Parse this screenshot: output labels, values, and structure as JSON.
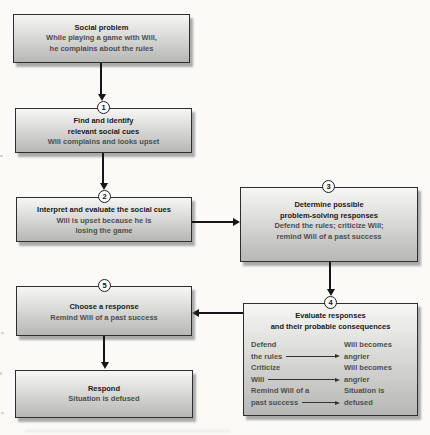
{
  "diagram": {
    "boxes": {
      "social_problem": {
        "title": "Social problem",
        "detail1": "While playing a game with Will,",
        "detail2": "he complains about the rules"
      },
      "find_cues": {
        "step": "1",
        "title1": "Find and identify",
        "title2": "relevant social cues",
        "detail1": "Will complains and looks upset"
      },
      "interpret_cues": {
        "step": "2",
        "title1": "Interpret and evaluate the social cues",
        "detail1": "Will is upset because he is",
        "detail2": "losing the game"
      },
      "determine_responses": {
        "step": "3",
        "title1": "Determine possible",
        "title2": "problem-solving responses",
        "detail1": "Defend the rules; criticize Will;",
        "detail2": "remind Will of a past success"
      },
      "evaluate_responses": {
        "step": "4",
        "title1": "Evaluate responses",
        "title2": "and their probable consequences",
        "pairs": [
          {
            "option1": "Defend",
            "option2": "the rules",
            "outcome1": "Will becomes",
            "outcome2": "angrier"
          },
          {
            "option1": "Criticize",
            "option2": "Will",
            "outcome1": "Will becomes",
            "outcome2": "angrier"
          },
          {
            "option1": "Remind Will of a",
            "option2": "past success",
            "outcome1": "Situation is",
            "outcome2": "defused"
          }
        ]
      },
      "choose_response": {
        "step": "5",
        "title1": "Choose a response",
        "detail1": "Remind Will of a past success"
      },
      "respond": {
        "title": "Respond",
        "detail1": "Situation is defused"
      }
    },
    "colors": {
      "page_bg": "#fbfaf7",
      "box_border": "#2e2e2e",
      "box_top": "#f6f6f4",
      "box_bottom": "#b7b7b5",
      "title_text": "#191919",
      "detail_text": "#4e4e4e",
      "arrow": "#161616",
      "circle_bg": "#fdfdfd"
    }
  }
}
